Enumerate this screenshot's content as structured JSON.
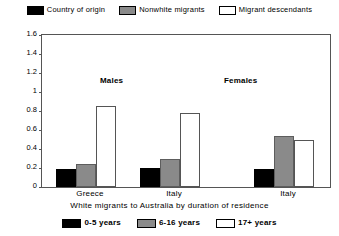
{
  "chart_data": {
    "type": "bar",
    "title": "",
    "xlabel": "White migrants to Australia by duration of residence",
    "ylabel": "",
    "ylim": [
      0,
      1.6
    ],
    "yticks": [
      "0",
      "0.2",
      "0.4",
      "0.6",
      "0.8",
      "1",
      "1.2",
      "1.4",
      "1.6"
    ],
    "ytick_values": [
      0,
      0.2,
      0.4,
      0.6,
      0.8,
      1.0,
      1.2,
      1.4,
      1.6
    ],
    "grid": false,
    "legend_position": "top",
    "categories": [
      "Greece",
      "Italy",
      "Italy"
    ],
    "series": [
      {
        "name": "0-5 years",
        "color": "#000000",
        "values": [
          0.19,
          0.2,
          0.19
        ]
      },
      {
        "name": "6-16 years",
        "color": "#8a8a8a",
        "values": [
          0.24,
          0.3,
          0.54
        ]
      },
      {
        "name": "17+ years",
        "color": "#ffffff",
        "values": [
          0.85,
          0.78,
          0.5
        ]
      }
    ],
    "annotations": [
      {
        "text": "Males",
        "group": 0
      },
      {
        "text": "Females",
        "group": 2
      }
    ],
    "top_legend": [
      {
        "label": "Country of origin",
        "swatch": "black"
      },
      {
        "label": "Nonwhite migrants",
        "swatch": "gray"
      },
      {
        "label": "Migrant descendants",
        "swatch": "white"
      }
    ],
    "bottom_legend": [
      {
        "label": "0-5 years",
        "swatch": "black"
      },
      {
        "label": "6-16 years",
        "swatch": "gray"
      },
      {
        "label": "17+ years",
        "swatch": "white"
      }
    ]
  },
  "top_legend": {
    "items": [
      {
        "label": "Country of origin"
      },
      {
        "label": "Nonwhite migrants"
      },
      {
        "label": "Migrant descendants"
      }
    ]
  },
  "bottom_legend": {
    "items": [
      {
        "label": "0-5 years"
      },
      {
        "label": "6-16 years"
      },
      {
        "label": "17+ years"
      }
    ]
  },
  "axis": {
    "yticks": [
      "1.6",
      "1.4",
      "1.2",
      "1",
      "0.8",
      "0.6",
      "0.4",
      "0.2",
      "0"
    ],
    "xlabels": [
      "Greece",
      "Italy",
      "Italy"
    ]
  },
  "annotations": {
    "males": "Males",
    "females": "Females"
  },
  "caption": {
    "text": "White migrants to Australia by duration of residence"
  }
}
